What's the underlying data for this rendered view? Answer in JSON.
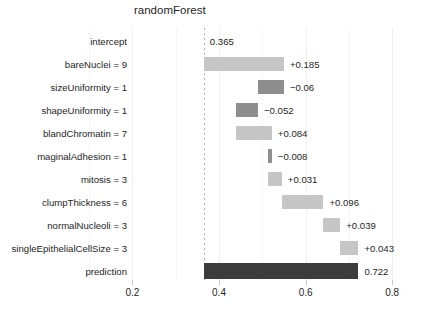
{
  "chart_data": {
    "type": "bar",
    "title": "randomForest",
    "xlabel": "",
    "ylabel": "",
    "xlim": [
      0.2,
      0.8
    ],
    "ylim": null,
    "grid": true,
    "legend": null,
    "baseline": 0.365,
    "prediction": 0.722,
    "orientation": "horizontal",
    "plot_style": "break-down waterfall",
    "xticks": [
      0.2,
      0.4,
      0.6,
      0.8
    ],
    "xticklabels": [
      "0.2",
      "0.4",
      "0.6",
      "0.8"
    ],
    "categories": [
      "intercept",
      "bareNuclei = 9",
      "sizeUniformity = 1",
      "shapeUniformity = 1",
      "blandChromatin = 7",
      "maginalAdhesion = 1",
      "mitosis = 3",
      "clumpThickness = 6",
      "normalNucleoli = 3",
      "singleEpithelialCellSize = 3",
      "prediction"
    ],
    "contributions": [
      0.365,
      0.185,
      -0.06,
      -0.052,
      0.084,
      -0.008,
      0.031,
      0.096,
      0.039,
      0.043,
      0.722
    ],
    "value_labels": [
      "0.365",
      "+0.185",
      "−0.06",
      "−0.052",
      "+0.084",
      "−0.008",
      "+0.031",
      "+0.096",
      "+0.039",
      "+0.043",
      "0.722"
    ],
    "cumulative_start": [
      0.365,
      0.365,
      0.55,
      0.49,
      0.438,
      0.522,
      0.514,
      0.545,
      0.641,
      0.68,
      0.365
    ],
    "cumulative_end": [
      0.365,
      0.55,
      0.49,
      0.438,
      0.522,
      0.514,
      0.545,
      0.641,
      0.68,
      0.722,
      0.722
    ],
    "bar_kinds": [
      "none",
      "pos",
      "neg",
      "neg",
      "pos",
      "neg",
      "pos",
      "pos",
      "pos",
      "pos",
      "total"
    ],
    "colors": {
      "positive": "#c6c6c6",
      "negative": "#8e8e8e",
      "total": "#3c3c3c",
      "background": "#ffffff",
      "grid": "#f0f0f0",
      "text": "#262626"
    }
  }
}
